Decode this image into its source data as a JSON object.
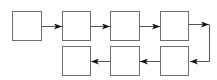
{
  "diagram": {
    "type": "flow",
    "colors": {
      "box_stroke": "#6e6e6e",
      "box_fill": "#ffffff",
      "arrow": "#555555",
      "arrowhead": "#111111"
    },
    "nodes": [
      {
        "id": "n1",
        "row": 0,
        "x": 12,
        "y": 11,
        "w": 29,
        "h": 29,
        "label": ""
      },
      {
        "id": "n2",
        "row": 0,
        "x": 62,
        "y": 11,
        "w": 28,
        "h": 29,
        "label": ""
      },
      {
        "id": "n3",
        "row": 0,
        "x": 110,
        "y": 11,
        "w": 29,
        "h": 29,
        "label": ""
      },
      {
        "id": "n4",
        "row": 0,
        "x": 160,
        "y": 11,
        "w": 28,
        "h": 29,
        "label": ""
      },
      {
        "id": "n5",
        "row": 1,
        "x": 160,
        "y": 46,
        "w": 28,
        "h": 29,
        "label": ""
      },
      {
        "id": "n6",
        "row": 1,
        "x": 110,
        "y": 46,
        "w": 29,
        "h": 29,
        "label": ""
      },
      {
        "id": "n7",
        "row": 1,
        "x": 62,
        "y": 46,
        "w": 28,
        "h": 29,
        "label": ""
      }
    ],
    "edges": [
      {
        "from": "n1",
        "to": "n2"
      },
      {
        "from": "n2",
        "to": "n3"
      },
      {
        "from": "n3",
        "to": "n4"
      },
      {
        "from": "n4",
        "to": "n5",
        "route": "right-loop"
      },
      {
        "from": "n5",
        "to": "n6"
      },
      {
        "from": "n6",
        "to": "n7"
      }
    ]
  }
}
